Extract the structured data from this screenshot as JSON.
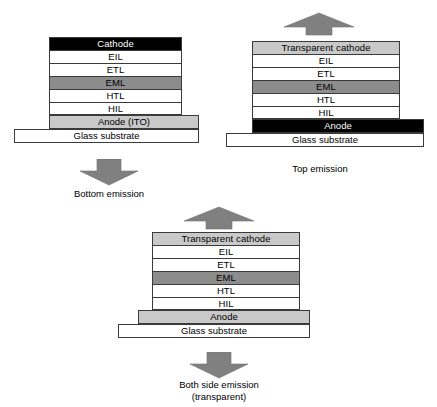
{
  "figure": {
    "colors": {
      "cathode_opaque": "#000000",
      "cathode_transparent": "#c9c9c9",
      "emissive_layer": "#8c8c8c",
      "anode_ito": "#c9c9c9",
      "anode_opaque": "#000000",
      "substrate": "#ffffff",
      "arrow": "#808080",
      "outline": "#3a3a3a"
    }
  },
  "devices": [
    {
      "id": "bottom-emission",
      "caption": "Bottom emission",
      "emission_direction": "down",
      "layers": [
        {
          "label": "Cathode",
          "fill": "black"
        },
        {
          "label": "EIL",
          "fill": "white"
        },
        {
          "label": "ETL",
          "fill": "white"
        },
        {
          "label": "EML",
          "fill": "midgray"
        },
        {
          "label": "HTL",
          "fill": "white"
        },
        {
          "label": "HIL",
          "fill": "white"
        }
      ],
      "anode": {
        "label": "Anode (ITO)",
        "fill": "ltgray"
      },
      "substrate": {
        "label": "Glass substrate",
        "fill": "white"
      }
    },
    {
      "id": "top-emission",
      "caption": "Top emission",
      "emission_direction": "up",
      "layers": [
        {
          "label": "Transparent cathode",
          "fill": "ltgray"
        },
        {
          "label": "EIL",
          "fill": "white"
        },
        {
          "label": "ETL",
          "fill": "white"
        },
        {
          "label": "EML",
          "fill": "midgray"
        },
        {
          "label": "HTL",
          "fill": "white"
        },
        {
          "label": "HIL",
          "fill": "white"
        }
      ],
      "anode": {
        "label": "Anode",
        "fill": "black"
      },
      "substrate": {
        "label": "Glass substrate",
        "fill": "white"
      }
    },
    {
      "id": "both-side-emission",
      "caption_line1": "Both side emission",
      "caption_line2": "(transparent)",
      "emission_direction": "both",
      "layers": [
        {
          "label": "Transparent cathode",
          "fill": "ltgray"
        },
        {
          "label": "EIL",
          "fill": "white"
        },
        {
          "label": "ETL",
          "fill": "white"
        },
        {
          "label": "EML",
          "fill": "midgray"
        },
        {
          "label": "HTL",
          "fill": "white"
        },
        {
          "label": "HIL",
          "fill": "white"
        }
      ],
      "anode": {
        "label": "Anode",
        "fill": "ltgray"
      },
      "substrate": {
        "label": "Glass substrate",
        "fill": "white"
      }
    }
  ]
}
